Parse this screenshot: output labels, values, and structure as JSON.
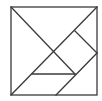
{
  "diagram": {
    "type": "tangram-square",
    "stroke_color": "#3a3a3a",
    "background": "#ffffff",
    "square": {
      "x1": 11,
      "y1": 7,
      "x2": 97,
      "y2": 95
    },
    "segments": [
      {
        "id": "diag-tl-center",
        "x1": 11,
        "y1": 7,
        "x2": 75,
        "y2": 74
      },
      {
        "id": "diag-bl-tr",
        "x1": 11,
        "y1": 95,
        "x2": 97,
        "y2": 7
      },
      {
        "id": "square-piece-upper",
        "x1": 75,
        "y1": 31,
        "x2": 97,
        "y2": 53
      },
      {
        "id": "parallelogram-edge",
        "x1": 97,
        "y1": 53,
        "x2": 56,
        "y2": 95
      },
      {
        "id": "small-triangle-base",
        "x1": 32,
        "y1": 74,
        "x2": 75,
        "y2": 74
      }
    ]
  }
}
